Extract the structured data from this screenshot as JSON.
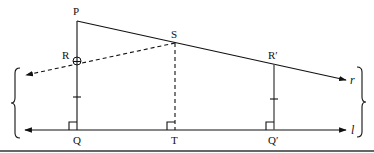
{
  "diagram": {
    "type": "geometry",
    "points": {
      "P": {
        "label": "P",
        "x": 77,
        "y": 21
      },
      "R": {
        "label": "R",
        "x": 77,
        "y": 61
      },
      "S": {
        "label": "S",
        "x": 175,
        "y": 43
      },
      "R_prime": {
        "label": "R′",
        "x": 274,
        "y": 64
      },
      "Q": {
        "label": "Q",
        "x": 77,
        "y": 130
      },
      "T": {
        "label": "T",
        "x": 175,
        "y": 130
      },
      "Q_prime": {
        "label": "Q′",
        "x": 274,
        "y": 130
      }
    },
    "lines": {
      "r": {
        "label": "r",
        "from": "P",
        "to_x": 346,
        "to_y": 80,
        "style": "solid",
        "arrow": "end"
      },
      "l": {
        "label": "l",
        "from_x": 25,
        "to_x": 346,
        "y": 130,
        "style": "solid",
        "arrow": "both"
      },
      "SR_extended": {
        "from": "S",
        "through": "R",
        "to_x": 26,
        "to_y": 75,
        "style": "dashed",
        "arrow": "end"
      },
      "PQ": {
        "from": "P",
        "to": "Q",
        "style": "solid",
        "tick_mark": true,
        "right_angle_at": "Q"
      },
      "ST": {
        "from": "S",
        "to": "T",
        "style": "dashed",
        "right_angle_at": "T"
      },
      "RprimeQprime": {
        "from": "R_prime",
        "to": "Q_prime",
        "style": "solid",
        "tick_mark": true,
        "right_angle_at": "Q_prime"
      }
    },
    "braces": {
      "left": {
        "x": 15,
        "y_top": 68,
        "y_bottom": 138
      },
      "right": {
        "x": 362,
        "y_top": 67,
        "y_bottom": 137
      }
    },
    "colors": {
      "line": "#111111",
      "segment_gray": "#555555",
      "background": "#ffffff"
    }
  }
}
